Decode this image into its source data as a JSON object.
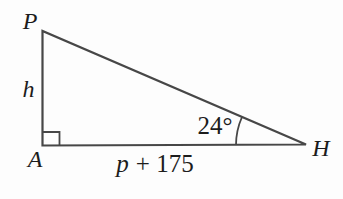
{
  "diagram": {
    "background": "#fdfdfd",
    "line_color": "#474747",
    "text_color": "#1c1c1c",
    "vertex_labels": {
      "top_left": "P",
      "bottom_left": "A",
      "bottom_right": "H"
    },
    "side_labels": {
      "left_side": "h",
      "base": {
        "variable": "p",
        "constant": "+ 175"
      }
    },
    "angle": {
      "value": "24°",
      "at_vertex": "H"
    },
    "right_angle": {
      "at_vertex": "A"
    }
  }
}
